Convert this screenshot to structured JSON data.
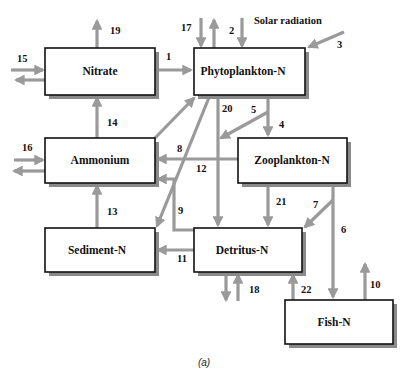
{
  "figure": {
    "caption": "(a)",
    "external_label": "Solar radiation"
  },
  "boxes": {
    "nitrate": "Nitrate",
    "phytoplankton": "Phytoplankton-N",
    "ammonium": "Ammonium",
    "zooplankton": "Zooplankton-N",
    "sediment": "Sediment-N",
    "detritus": "Detritus-N",
    "fish": "Fish-N"
  },
  "flows": {
    "f1": "1",
    "f2": "2",
    "f3": "3",
    "f4": "4",
    "f5": "5",
    "f6": "6",
    "f7": "7",
    "f8": "8",
    "f9": "9",
    "f10": "10",
    "f11": "11",
    "f12": "12",
    "f13": "13",
    "f14": "14",
    "f15": "15",
    "f16": "16",
    "f17": "17",
    "f18": "18",
    "f19": "19",
    "f20": "20",
    "f21": "21",
    "f22": "22"
  },
  "colors": {
    "arrow": "#9a9a9a",
    "box_border": "#111111",
    "box_shadow": "#8a8a8a"
  }
}
